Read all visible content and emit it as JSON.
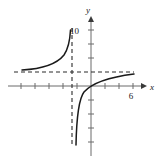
{
  "figure": {
    "kind": "rational-function-graph",
    "background_color": "#ffffff",
    "curve_color": "#1a1a1a",
    "axis_color": "#6b6b6b",
    "asymptote_color": "#2b2b2b"
  },
  "axes": {
    "x_axis": {
      "label": "x",
      "label_x": 150,
      "label_y": 90,
      "line_y": 86,
      "line_x_start": 8,
      "line_x_end": 144,
      "arrow": true,
      "tick_spacing": 14,
      "tick_half_length": 3
    },
    "y_axis": {
      "label": "y",
      "label_x": 88,
      "label_y": 11,
      "line_x": 91,
      "line_y_start": 16,
      "line_y_end": 156,
      "arrow": true,
      "tick_spacing": 14,
      "tick_half_length": 3
    }
  },
  "tick_labels": [
    {
      "text": "10",
      "x": 79,
      "y": 31,
      "axis": "y"
    },
    {
      "text": "6",
      "x": 130,
      "y": 99,
      "axis": "x"
    }
  ],
  "asymptotes": {
    "vertical": {
      "x": 72,
      "y_start": 28,
      "y_end": 145,
      "style": "dashed"
    },
    "horizontal": {
      "y": 72,
      "x_start": 14,
      "x_end": 134,
      "style": "dashed"
    }
  },
  "curve_branches": [
    {
      "name": "left-branch",
      "path": "M 22,70 C 40,69 56,65 64,55 C 68,49 70,40 70.5,30"
    },
    {
      "name": "right-branch",
      "path": "M 76,145 C 76.5,120 78,100 84,92 C 92,83 110,77 134,74"
    }
  ]
}
